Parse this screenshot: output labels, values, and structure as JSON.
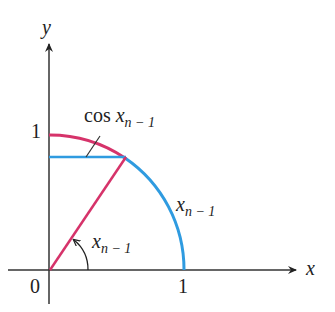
{
  "axes": {
    "x_label": "x",
    "y_label": "y",
    "origin_label": "0",
    "x_tick_label": "1",
    "y_tick_label": "1"
  },
  "labels": {
    "cos_label_prefix": "cos",
    "cos_label_var": "x",
    "cos_label_sub": "n − 1",
    "arc_label_var": "x",
    "arc_label_sub": "n − 1",
    "angle_label_var": "x",
    "angle_label_sub": "n − 1"
  },
  "colors": {
    "red": "#d6336a",
    "blue": "#2f9be0",
    "axis": "#222222"
  },
  "geometry": {
    "angle_deg": 56
  }
}
